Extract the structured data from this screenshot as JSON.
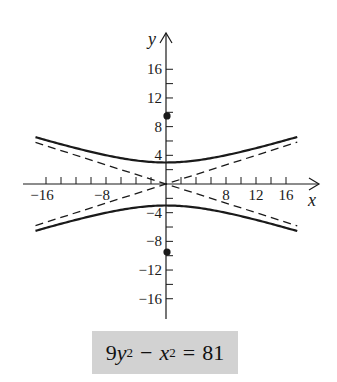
{
  "chart_data": {
    "type": "line",
    "title": "",
    "equation": "9y^2 - x^2 = 81",
    "xlabel": "x",
    "ylabel": "y",
    "xlim": [
      -17.4,
      17.5
    ],
    "ylim": [
      -18,
      18
    ],
    "grid": false,
    "minor_tick_step": 2,
    "x_tick_labels": [
      -16,
      -8,
      8,
      12,
      16
    ],
    "y_tick_labels": [
      16,
      12,
      8,
      4,
      -4,
      -8,
      -12,
      -16
    ],
    "hyperbola": {
      "orientation": "vertical",
      "a": 3,
      "b": 9,
      "center": [
        0,
        0
      ]
    },
    "series": [
      {
        "name": "upper branch",
        "style": "solid",
        "x": [
          -17.4,
          -16,
          -12,
          -8,
          -4,
          0,
          4,
          8,
          12,
          16,
          17.5
        ],
        "values": [
          6.53,
          6.12,
          5.0,
          4.01,
          3.28,
          3.0,
          3.28,
          4.01,
          5.0,
          6.12,
          6.56
        ]
      },
      {
        "name": "lower branch",
        "style": "solid",
        "x": [
          -17.4,
          -16,
          -12,
          -8,
          -4,
          0,
          4,
          8,
          12,
          16,
          17.5
        ],
        "values": [
          -6.53,
          -6.12,
          -5.0,
          -4.01,
          -3.28,
          -3.0,
          -3.28,
          -4.01,
          -5.0,
          -6.12,
          -6.56
        ]
      },
      {
        "name": "asymptote y = x/3",
        "style": "dashed",
        "x": [
          -17.4,
          17.5
        ],
        "values": [
          -5.8,
          5.83
        ]
      },
      {
        "name": "asymptote y = -x/3",
        "style": "dashed",
        "x": [
          -17.4,
          17.5
        ],
        "values": [
          5.8,
          -5.83
        ]
      }
    ],
    "points": [
      {
        "label": "focus",
        "x": 0,
        "y": 9.49
      },
      {
        "label": "focus",
        "x": 0,
        "y": -9.49
      }
    ]
  },
  "equation_box": {
    "coef": "9",
    "var1": "y",
    "exp1": "2",
    "minus": "−",
    "var2": "x",
    "exp2": "2",
    "equals": "=",
    "rhs": "81"
  },
  "colors": {
    "ink": "#1a1a1a",
    "box": "#d2d2d2"
  }
}
